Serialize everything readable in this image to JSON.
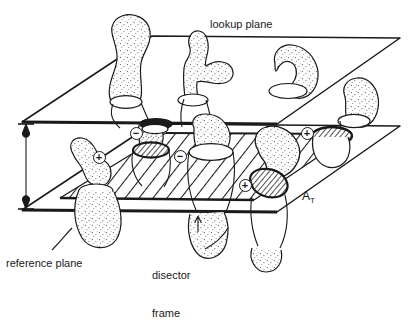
{
  "figure": {
    "kind": "stereology-disector-diagram",
    "background": "#ffffff",
    "ink": "#1a1a1a",
    "width": 417,
    "height": 276
  },
  "labels": {
    "lookup_plane": "lookup plane",
    "reference_plane": "reference plane",
    "disector_frame_line1": "disector",
    "disector_frame_line2": "frame",
    "area_symbol": "A",
    "area_subscript": "T"
  },
  "markers": {
    "plus": "+",
    "minus": "−",
    "counted_plus": [
      {
        "id": "plus-left",
        "x": 99,
        "y": 157,
        "sign": "+"
      },
      {
        "id": "plus-mid",
        "x": 245,
        "y": 185,
        "sign": "+"
      },
      {
        "id": "plus-right",
        "x": 307,
        "y": 133,
        "sign": "+"
      }
    ],
    "excluded_minus": [
      {
        "id": "minus-upper",
        "x": 136,
        "y": 133,
        "sign": "−"
      },
      {
        "id": "minus-lower",
        "x": 180,
        "y": 156,
        "sign": "−"
      }
    ]
  },
  "planes": {
    "lookup": {
      "name": "lookup plane",
      "points": "22,122 152,36 400,38 277,124"
    },
    "reference": {
      "name": "reference plane",
      "points": "22,210 152,124 400,126 277,212"
    }
  },
  "disector_frame": {
    "name": "disector frame",
    "points": "60,198 166,133 352,134 254,200",
    "hatch_angle_deg": -52
  },
  "height_arrow": {
    "name": "disector-height-arrow",
    "x": 26,
    "y_top": 124,
    "y_bottom": 208
  },
  "particles": [
    {
      "id": "p-topleft",
      "desc": "club-shaped particle above lookup plane"
    },
    {
      "id": "p-branching",
      "desc": "branching Y particle through lookup plane"
    },
    {
      "id": "p-crescent",
      "desc": "crescent particle on lookup plane"
    },
    {
      "id": "p-right",
      "desc": "ovoid particle at right edge"
    },
    {
      "id": "p-botleft",
      "desc": "particle through reference plane at left"
    },
    {
      "id": "p-counted1",
      "desc": "particle with hatched profile, counted +"
    },
    {
      "id": "p-counted2",
      "desc": "large kidney particle with hatched profile, counted +"
    },
    {
      "id": "p-counted3",
      "desc": "right particle with hatched profile, counted +"
    }
  ]
}
